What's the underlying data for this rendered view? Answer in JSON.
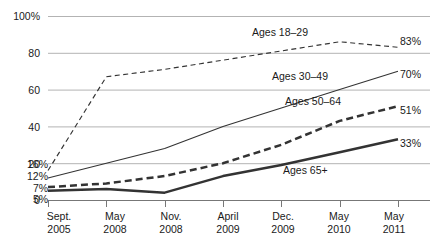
{
  "chart_data": {
    "type": "line",
    "title": "",
    "subtitle": "",
    "xlabel": "",
    "ylabel": "",
    "ylim": [
      0,
      100
    ],
    "grid": true,
    "legend_position": "inline-annotations",
    "categories": [
      "Sept. 2005",
      "May 2008",
      "Nov. 2008",
      "April 2009",
      "Dec. 2009",
      "May 2010",
      "May 2011"
    ],
    "x_ticks": [
      {
        "month": "Sept.",
        "year": "2005"
      },
      {
        "month": "May",
        "year": "2008"
      },
      {
        "month": "Nov.",
        "year": "2008"
      },
      {
        "month": "April",
        "year": "2009"
      },
      {
        "month": "Dec.",
        "year": "2009"
      },
      {
        "month": "May",
        "year": "2010"
      },
      {
        "month": "May",
        "year": "2011"
      }
    ],
    "y_ticks": [
      "100%",
      "80",
      "60",
      "40",
      "20",
      "0"
    ],
    "y_tick_values": [
      100,
      80,
      60,
      40,
      20,
      0
    ],
    "series": [
      {
        "name": "Ages 18–29",
        "style": "dashed-thin",
        "values": [
          16,
          67,
          71,
          76,
          81,
          86,
          83
        ],
        "start_label": "16%",
        "end_label": "83%",
        "label": "Ages 18–29"
      },
      {
        "name": "Ages 30–49",
        "style": "solid-thin",
        "values": [
          12,
          20,
          28,
          40,
          50,
          60,
          70
        ],
        "start_label": "12%",
        "end_label": "70%",
        "label": "Ages 30–49"
      },
      {
        "name": "Ages 50–64",
        "style": "dashed-thick",
        "values": [
          7,
          9,
          13,
          20,
          30,
          43,
          51
        ],
        "start_label": "7%",
        "end_label": "51%",
        "label": "Ages 50–64"
      },
      {
        "name": "Ages 65+",
        "style": "solid-thick",
        "values": [
          5,
          6,
          4,
          13,
          19,
          26,
          33
        ],
        "start_label": "5%",
        "end_label": "33%",
        "label": "Ages 65+"
      }
    ],
    "annotations": [
      {
        "text": "Ages 18–29",
        "x": 252,
        "y": 33
      },
      {
        "text": "Ages 30–49",
        "x": 272,
        "y": 77
      },
      {
        "text": "Ages 50–64",
        "x": 285,
        "y": 101
      },
      {
        "text": "Ages 65+",
        "x": 283,
        "y": 170
      }
    ],
    "colors": {
      "line": "#333333",
      "grid": "#aaaaaa",
      "axis": "#777777",
      "text": "#1a1a1a",
      "background": "#ffffff"
    }
  }
}
